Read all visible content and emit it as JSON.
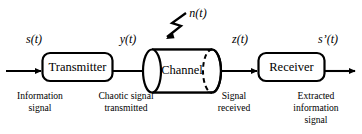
{
  "diagram": {
    "background_color": "#ffffff",
    "line_color": "#000000",
    "blocks": [
      {
        "id": "transmitter",
        "label": "Transmitter",
        "shape": "rounded-rect"
      },
      {
        "id": "channel",
        "label": "Channel",
        "shape": "cylinder"
      },
      {
        "id": "receiver",
        "label": "Receiver",
        "shape": "rounded-rect"
      }
    ],
    "signals": [
      {
        "id": "s",
        "label": "s(t)",
        "italic": true
      },
      {
        "id": "y",
        "label": "y(t)",
        "italic": true
      },
      {
        "id": "n",
        "label": "n(t)",
        "italic": true
      },
      {
        "id": "z",
        "label": "z(t)",
        "italic": true
      },
      {
        "id": "s_prime",
        "label": "s’(t)",
        "italic": true
      }
    ],
    "captions": [
      {
        "id": "input-caption",
        "lines": [
          "Information",
          "signal"
        ]
      },
      {
        "id": "transmitted-caption",
        "lines": [
          "Chaotic signal",
          "transmitted"
        ]
      },
      {
        "id": "received-caption",
        "lines": [
          "Signal",
          "received"
        ]
      },
      {
        "id": "output-caption",
        "lines": [
          "Extracted",
          "information",
          "signal"
        ]
      }
    ],
    "arrows": [
      {
        "id": "input-arrow",
        "from": "source",
        "to": "transmitter"
      },
      {
        "id": "transmitter-to-channel-arrow",
        "from": "transmitter",
        "to": "channel"
      },
      {
        "id": "channel-to-receiver-arrow",
        "from": "channel",
        "to": "receiver"
      },
      {
        "id": "output-arrow",
        "from": "receiver",
        "to": "sink"
      },
      {
        "id": "noise-arrow",
        "from": "n(t)",
        "to": "channel",
        "style": "lightning-zigzag"
      }
    ]
  }
}
